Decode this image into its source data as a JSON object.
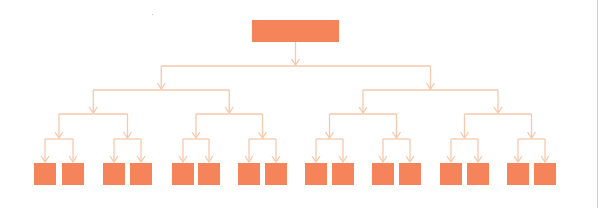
{
  "diagram": {
    "type": "hierarchy-tree",
    "levels": 5,
    "branching": 2,
    "colors": {
      "node_fill": "#F6845B",
      "connector": "#F4C9AC",
      "background": "#FFFFFF",
      "edge_line": "#EBCB98"
    },
    "root": {
      "x": 252,
      "y": 20,
      "w": 87,
      "h": 22,
      "label": ""
    },
    "connector_levels_y": [
      66,
      90,
      114,
      139
    ],
    "leaf_y": 163,
    "leaf_size": 22,
    "leaf_x": [
      34,
      62,
      103,
      130,
      172,
      198,
      238,
      265,
      305,
      332,
      372,
      399,
      440,
      467,
      507,
      534
    ],
    "leaf_labels": [
      "",
      "",
      "",
      "",
      "",
      "",
      "",
      "",
      "",
      "",
      "",
      "",
      "",
      "",
      "",
      ""
    ]
  }
}
